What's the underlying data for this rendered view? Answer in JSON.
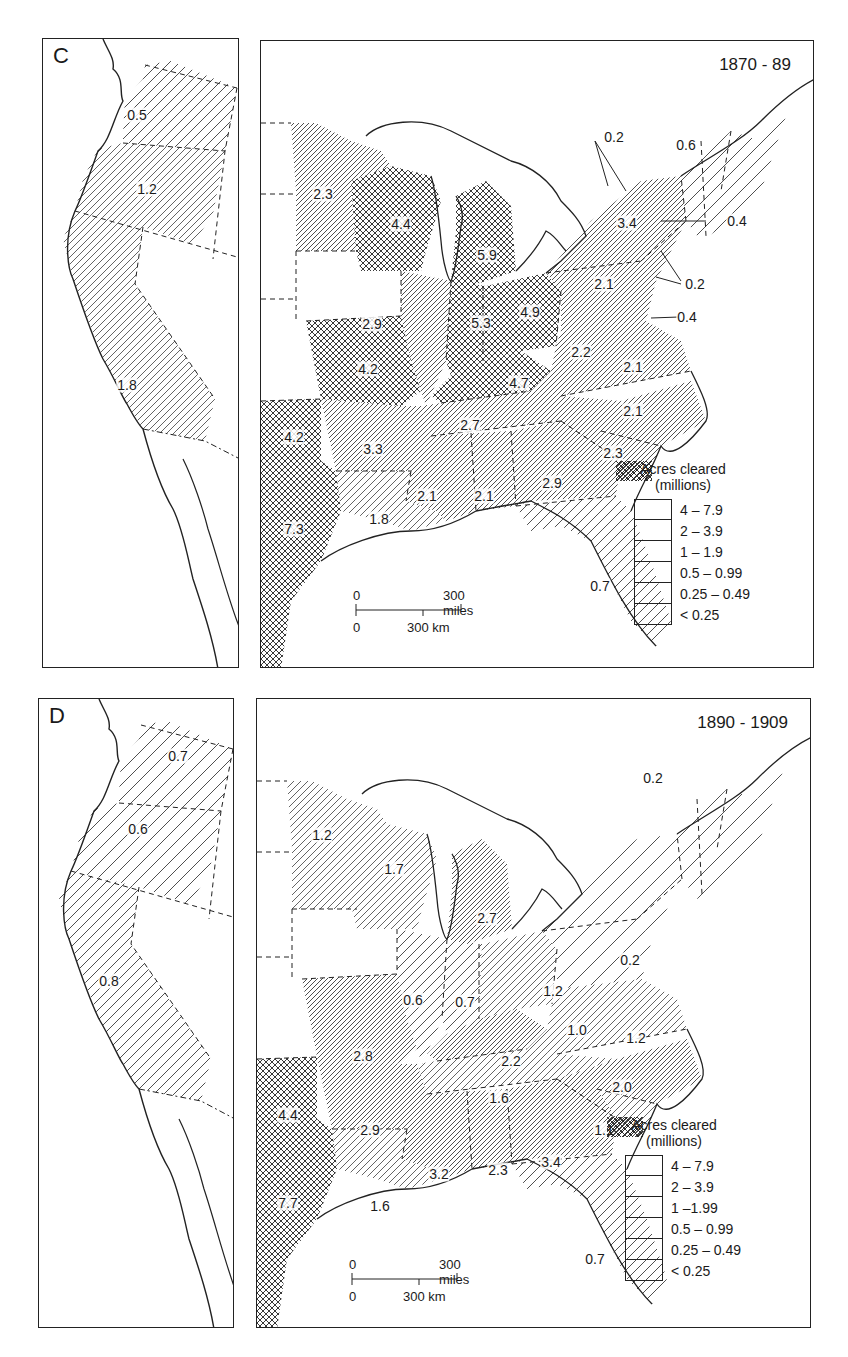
{
  "chart_data": [
    {
      "type": "choropleth-map",
      "panel": "C",
      "title": "1870 - 89",
      "legend_title": "Acres cleared (millions)",
      "legend": [
        "4 – 7.9",
        "2 – 3.9",
        "1 – 1.9",
        "0.5 – 0.99",
        "0.25 – 0.49",
        "< 0.25"
      ],
      "west_values": [
        "0.5",
        "1.2",
        "1.8"
      ],
      "east_values": [
        "2.3",
        "4.4",
        "5.9",
        "2.9",
        "5.3",
        "4.9",
        "4.2",
        "4.7",
        "2.2",
        "2.1",
        "2.1",
        "2.1",
        "3.4",
        "0.2",
        "0.6",
        "0.4",
        "0.2",
        "0.4",
        "4.2",
        "3.3",
        "2.7",
        "2.3",
        "7.3",
        "1.8",
        "2.1",
        "2.1",
        "2.9",
        "0.7"
      ],
      "scale": {
        "miles": "300 miles",
        "km": "300 km",
        "zero": "0"
      }
    },
    {
      "type": "choropleth-map",
      "panel": "D",
      "title": "1890 - 1909",
      "legend_title": "Acres cleared (millions)",
      "legend": [
        "4 – 7.9",
        "2 – 3.9",
        "1 –1.99",
        "0.5 – 0.99",
        "0.25 – 0.49",
        "< 0.25"
      ],
      "west_values": [
        "0.7",
        "0.6",
        "0.8"
      ],
      "east_values": [
        "1.2",
        "1.7",
        "2.7",
        "0.2",
        "0.6",
        "0.7",
        "1.2",
        "0.2",
        "1.0",
        "1.2",
        "2.8",
        "2.2",
        "2.0",
        "4.4",
        "1.6",
        "2.9",
        "1.1",
        "3.4",
        "7.7",
        "1.6",
        "3.2",
        "2.3",
        "0.7"
      ],
      "scale": {
        "miles": "300 miles",
        "km": "300 km",
        "zero": "0"
      }
    }
  ],
  "panels": {
    "c": {
      "letter": "C",
      "period": "1870 - 89",
      "west": [
        {
          "v": "0.5",
          "x": 94,
          "y": 76
        },
        {
          "v": "1.2",
          "x": 104,
          "y": 150
        },
        {
          "v": "1.8",
          "x": 84,
          "y": 346
        }
      ],
      "east": [
        {
          "v": "2.3",
          "x": 62,
          "y": 153
        },
        {
          "v": "4.4",
          "x": 140,
          "y": 183
        },
        {
          "v": "5.9",
          "x": 226,
          "y": 214
        },
        {
          "v": "2.9",
          "x": 111,
          "y": 283
        },
        {
          "v": "5.3",
          "x": 220,
          "y": 282
        },
        {
          "v": "4.9",
          "x": 269,
          "y": 271
        },
        {
          "v": "2.1",
          "x": 343,
          "y": 243
        },
        {
          "v": "4.2",
          "x": 107,
          "y": 328
        },
        {
          "v": "4.7",
          "x": 258,
          "y": 342
        },
        {
          "v": "2.2",
          "x": 320,
          "y": 311
        },
        {
          "v": "2.1",
          "x": 372,
          "y": 326
        },
        {
          "v": "3.4",
          "x": 366,
          "y": 182
        },
        {
          "v": "2.7",
          "x": 209,
          "y": 384
        },
        {
          "v": "2.1",
          "x": 372,
          "y": 370
        },
        {
          "v": "4.2",
          "x": 33,
          "y": 396
        },
        {
          "v": "3.3",
          "x": 112,
          "y": 408
        },
        {
          "v": "2.3",
          "x": 352,
          "y": 412
        },
        {
          "v": "2.1",
          "x": 166,
          "y": 455
        },
        {
          "v": "2.1",
          "x": 223,
          "y": 455
        },
        {
          "v": "2.9",
          "x": 291,
          "y": 442
        },
        {
          "v": "7.3",
          "x": 33,
          "y": 488
        },
        {
          "v": "1.8",
          "x": 118,
          "y": 478
        },
        {
          "v": "0.7",
          "x": 339,
          "y": 545
        }
      ],
      "leaders": [
        {
          "v": "0.2",
          "x": 353,
          "y": 96
        },
        {
          "v": "0.6",
          "x": 425,
          "y": 104
        },
        {
          "v": "0.4",
          "x": 476,
          "y": 180
        },
        {
          "v": "0.2",
          "x": 434,
          "y": 243
        },
        {
          "v": "0.4",
          "x": 426,
          "y": 276
        }
      ]
    },
    "d": {
      "letter": "D",
      "period": "1890 - 1909",
      "west": [
        {
          "v": "0.7",
          "x": 139,
          "y": 57
        },
        {
          "v": "0.6",
          "x": 99,
          "y": 130
        },
        {
          "v": "0.8",
          "x": 70,
          "y": 282
        }
      ],
      "east": [
        {
          "v": "1.2",
          "x": 65,
          "y": 136
        },
        {
          "v": "1.7",
          "x": 137,
          "y": 170
        },
        {
          "v": "2.7",
          "x": 230,
          "y": 219
        },
        {
          "v": "0.2",
          "x": 396,
          "y": 79
        },
        {
          "v": "0.6",
          "x": 156,
          "y": 301
        },
        {
          "v": "0.7",
          "x": 208,
          "y": 303
        },
        {
          "v": "1.2",
          "x": 296,
          "y": 292
        },
        {
          "v": "0.2",
          "x": 373,
          "y": 261
        },
        {
          "v": "1.0",
          "x": 320,
          "y": 331
        },
        {
          "v": "1.2",
          "x": 379,
          "y": 339
        },
        {
          "v": "2.8",
          "x": 106,
          "y": 357
        },
        {
          "v": "2.2",
          "x": 254,
          "y": 362
        },
        {
          "v": "2.0",
          "x": 365,
          "y": 388
        },
        {
          "v": "4.4",
          "x": 31,
          "y": 416
        },
        {
          "v": "1.6",
          "x": 242,
          "y": 399
        },
        {
          "v": "2.9",
          "x": 113,
          "y": 431
        },
        {
          "v": "1.1",
          "x": 347,
          "y": 431
        },
        {
          "v": "3.4",
          "x": 294,
          "y": 463
        },
        {
          "v": "7.7",
          "x": 31,
          "y": 504
        },
        {
          "v": "1.6",
          "x": 123,
          "y": 507
        },
        {
          "v": "3.2",
          "x": 182,
          "y": 475
        },
        {
          "v": "2.3",
          "x": 241,
          "y": 471
        },
        {
          "v": "0.7",
          "x": 338,
          "y": 560
        }
      ],
      "leaders": []
    }
  },
  "legend": {
    "title_line1": "Acres cleared",
    "title_line2": "(millions)",
    "c_items": [
      "4 – 7.9",
      "2 – 3.9",
      "1 – 1.9",
      "0.5 – 0.99",
      "0.25 – 0.49",
      "< 0.25"
    ],
    "d_items": [
      "4 – 7.9",
      "2 – 3.9",
      "1 –1.99",
      "0.5 – 0.99",
      "0.25 – 0.49",
      "< 0.25"
    ]
  },
  "scale_bar": {
    "zero": "0",
    "miles": "300 miles",
    "km": "300 km"
  },
  "colors": {
    "ink": "#1a1a1a",
    "paper": "#ffffff"
  }
}
